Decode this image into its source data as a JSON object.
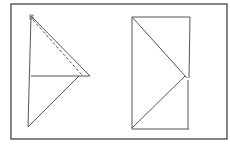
{
  "diagram": {
    "type": "geometric-folding-figures",
    "background": "#ffffff",
    "stroke_color": "#3a3a3a",
    "frame": {
      "x1": 11,
      "y1": 4,
      "x2": 227,
      "y2": 139
    },
    "left_figure": {
      "vertical_edge": {
        "x1": 31,
        "y1": 16,
        "x2": 28,
        "y2": 127
      },
      "upper_triangle": {
        "apex": [
          31,
          16
        ],
        "right_vertex": [
          90,
          76
        ],
        "base_left": [
          31,
          76
        ]
      },
      "dashed_fold_line": {
        "x1": 33,
        "y1": 20,
        "x2": 82,
        "y2": 75
      },
      "lower_diagonal": {
        "x1": 79,
        "y1": 76,
        "x2": 28,
        "y2": 127
      }
    },
    "right_figure": {
      "rectangle": {
        "x": 132,
        "y": 17,
        "width": 58,
        "height": 112
      },
      "upper_diagonal": {
        "x1": 132,
        "y1": 17,
        "x2": 188,
        "y2": 78
      },
      "lower_diagonal": {
        "x1": 186,
        "y1": 76,
        "x2": 132,
        "y2": 128
      }
    }
  }
}
